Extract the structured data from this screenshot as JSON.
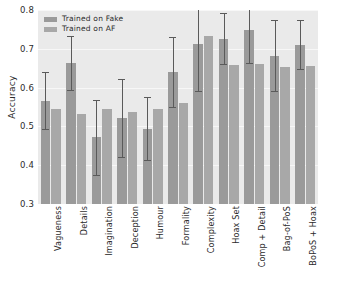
{
  "chart_data": {
    "type": "bar",
    "title": "",
    "xlabel": "",
    "ylabel": "Accuracy",
    "ylim": [
      0.3,
      0.8
    ],
    "yticks": [
      "0.3",
      "0.4",
      "0.5",
      "0.6",
      "0.7",
      "0.8"
    ],
    "ytick_values": [
      0.3,
      0.4,
      0.5,
      0.6,
      0.7,
      0.8
    ],
    "grid": true,
    "legend_position": "upper left",
    "categories": [
      "Vagueness",
      "Details",
      "Imagination",
      "Deception",
      "Humour",
      "Formality",
      "Complexity",
      "Hoax Set",
      "Comp + Detail",
      "Bag-of-PoS",
      "BoPoS + Hoax"
    ],
    "series": [
      {
        "name": "Trained on Fake",
        "color": "#9a9a9a",
        "values": [
          0.566,
          0.664,
          0.472,
          0.521,
          0.494,
          0.64,
          0.712,
          0.726,
          0.749,
          0.682,
          0.711
        ],
        "errors": [
          0.073,
          0.07,
          0.097,
          0.1,
          0.081,
          0.09,
          0.121,
          0.066,
          0.085,
          0.092,
          0.062
        ]
      },
      {
        "name": "Trained on AF",
        "color": "#a8a8a8",
        "values": [
          0.544,
          0.531,
          0.544,
          0.536,
          0.544,
          0.56,
          0.734,
          0.657,
          0.661,
          0.653,
          0.655
        ],
        "errors": [
          0,
          0,
          0,
          0,
          0,
          0,
          0,
          0,
          0,
          0,
          0
        ]
      }
    ]
  },
  "legend": {
    "items": [
      {
        "label": "Trained on Fake"
      },
      {
        "label": "Trained on AF"
      }
    ]
  }
}
